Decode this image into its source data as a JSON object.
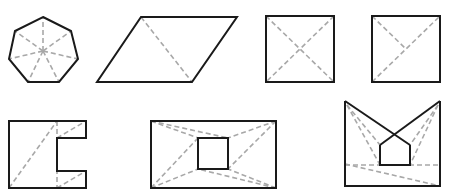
{
  "figure": {
    "colors": {
      "outline": "#1a1a1a",
      "diagonal": "#a8a8a8",
      "background": "#ffffff"
    },
    "shapes": [
      {
        "id": "heptagon",
        "kind": "regular heptagon",
        "diagonals": "fan from center"
      },
      {
        "id": "parallelogram",
        "kind": "parallelogram",
        "diagonals": "one diagonal"
      },
      {
        "id": "square-x",
        "kind": "square",
        "diagonals": "both diagonals"
      },
      {
        "id": "square-y",
        "kind": "square",
        "diagonals": "one diagonal plus half diagonal"
      },
      {
        "id": "c-shape",
        "kind": "C-shaped polygon",
        "diagonals": "four dashed splits"
      },
      {
        "id": "rect-hole",
        "kind": "rectangle with square hole",
        "diagonals": "eight corner connectors"
      },
      {
        "id": "m-shape",
        "kind": "non-convex polygon with house-shaped notch",
        "diagonals": "six dashed splits"
      }
    ]
  }
}
